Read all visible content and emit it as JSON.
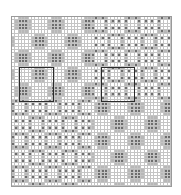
{
  "diagram": {
    "title": "",
    "grid": {
      "cols": 48,
      "rows": 51,
      "line_color": "#c4c4c4",
      "bg": "#ffffff",
      "dot_color": "#555555",
      "shade_color": "#b8b8b8"
    },
    "quadrants": [
      {
        "name": "top-left",
        "motif": "rosette",
        "col0": 0,
        "row0": 0,
        "cols": 24,
        "rows": 25
      },
      {
        "name": "top-right",
        "motif": "square-tiles",
        "col0": 24,
        "row0": 0,
        "cols": 24,
        "rows": 25
      },
      {
        "name": "bottom-left",
        "motif": "square-tiles",
        "col0": 0,
        "row0": 25,
        "cols": 24,
        "rows": 26
      },
      {
        "name": "bottom-right",
        "motif": "rosette",
        "col0": 24,
        "row0": 25,
        "cols": 24,
        "rows": 26
      }
    ],
    "highlight_boxes": [
      {
        "name": "repeat-box-rosette",
        "left": 19,
        "top": 67,
        "width": 35,
        "height": 35
      },
      {
        "name": "repeat-box-square",
        "left": 101,
        "top": 67,
        "width": 34,
        "height": 35
      }
    ]
  }
}
